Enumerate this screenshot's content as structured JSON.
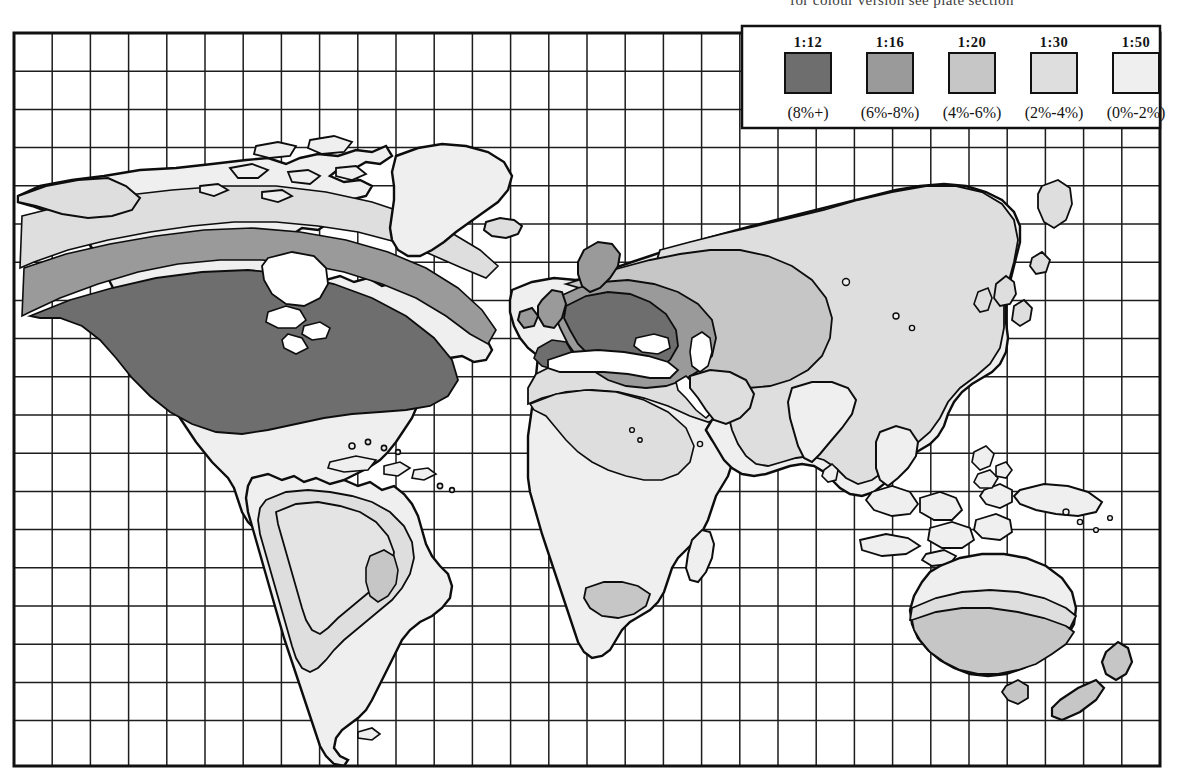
{
  "caption": {
    "text": "for colour version see plate section"
  },
  "map": {
    "title": "World distribution map with shaded ratio classes",
    "projection": "cylindrical",
    "grid": {
      "visible": true,
      "columns": 30,
      "rows": 19,
      "cell_px": 38.2,
      "line_color": "#1d1d1d"
    },
    "frame": {
      "left": 14,
      "top": 33,
      "right": 1160,
      "bottom": 766,
      "border_color": "#111111"
    },
    "ocean_color": "#ffffff",
    "coastline_color": "#0d0d0d"
  },
  "legend": {
    "name": "shading-legend",
    "box": {
      "x": 742,
      "y": 26,
      "width": 418,
      "height": 102
    },
    "entries": [
      {
        "ratio": "1:12",
        "range": "(8%+)",
        "color": "#6e6e6e"
      },
      {
        "ratio": "1:16",
        "range": "(6%-8%)",
        "color": "#9a9a9a"
      },
      {
        "ratio": "1:20",
        "range": "(4%-6%)",
        "color": "#c6c6c6"
      },
      {
        "ratio": "1:30",
        "range": "(2%-4%)",
        "color": "#dedede"
      },
      {
        "ratio": "1:50",
        "range": "(0%-2%)",
        "color": "#efefef"
      }
    ]
  },
  "chart_data": {
    "type": "heatmap",
    "xlabel": "",
    "ylabel": "",
    "legend_position": "top-right",
    "grid": true,
    "classes": [
      {
        "label": "1:12",
        "range": "(8%+)",
        "value_low": 8,
        "value_high": null,
        "color": "#6e6e6e"
      },
      {
        "label": "1:16",
        "range": "(6%-8%)",
        "value_low": 6,
        "value_high": 8,
        "color": "#9a9a9a"
      },
      {
        "label": "1:20",
        "range": "(4%-6%)",
        "value_low": 4,
        "value_high": 6,
        "color": "#c6c6c6"
      },
      {
        "label": "1:30",
        "range": "(2%-4%)",
        "value_low": 2,
        "value_high": 4,
        "color": "#dedede"
      },
      {
        "label": "1:50",
        "range": "(0%-2%)",
        "value_low": 0,
        "value_high": 2,
        "color": "#efefef"
      }
    ],
    "regions": [
      {
        "name": "Alaska",
        "class": "1:30"
      },
      {
        "name": "Arctic Canada",
        "class": "1:50"
      },
      {
        "name": "Northern Canada",
        "class": "1:30"
      },
      {
        "name": "Southern Canada",
        "class": "1:16"
      },
      {
        "name": "United States",
        "class": "1:12"
      },
      {
        "name": "Mexico",
        "class": "1:30"
      },
      {
        "name": "Central America",
        "class": "1:50"
      },
      {
        "name": "Greenland",
        "class": "1:50"
      },
      {
        "name": "Iceland",
        "class": "1:30"
      },
      {
        "name": "British Isles",
        "class": "1:16"
      },
      {
        "name": "Western Europe",
        "class": "1:12"
      },
      {
        "name": "Scandinavia",
        "class": "1:16"
      },
      {
        "name": "Iberia",
        "class": "1:16"
      },
      {
        "name": "Eastern Europe",
        "class": "1:16"
      },
      {
        "name": "Russia",
        "class": "1:20"
      },
      {
        "name": "Siberia",
        "class": "1:30"
      },
      {
        "name": "Central Asia",
        "class": "1:30"
      },
      {
        "name": "China",
        "class": "1:30"
      },
      {
        "name": "Japan",
        "class": "1:30"
      },
      {
        "name": "India",
        "class": "1:50"
      },
      {
        "name": "Southeast Asia",
        "class": "1:50"
      },
      {
        "name": "Indonesia",
        "class": "1:50"
      },
      {
        "name": "Philippines",
        "class": "1:50"
      },
      {
        "name": "North Africa",
        "class": "1:30"
      },
      {
        "name": "Sahara",
        "class": "1:30"
      },
      {
        "name": "West Africa",
        "class": "1:50"
      },
      {
        "name": "Central Africa",
        "class": "1:50"
      },
      {
        "name": "East Africa",
        "class": "1:50"
      },
      {
        "name": "Southern Africa",
        "class": "1:50"
      },
      {
        "name": "South Africa (Cape)",
        "class": "1:30"
      },
      {
        "name": "Madagascar",
        "class": "1:50"
      },
      {
        "name": "Middle East",
        "class": "1:30"
      },
      {
        "name": "Northern South America",
        "class": "1:50"
      },
      {
        "name": "Amazon Basin",
        "class": "1:30"
      },
      {
        "name": "Brazil interior",
        "class": "1:30"
      },
      {
        "name": "Southeast Brazil",
        "class": "1:20"
      },
      {
        "name": "Argentina",
        "class": "1:50"
      },
      {
        "name": "Northern Australia",
        "class": "1:30"
      },
      {
        "name": "Southern Australia",
        "class": "1:20"
      },
      {
        "name": "New Zealand",
        "class": "1:20"
      },
      {
        "name": "New Guinea",
        "class": "1:50"
      }
    ]
  }
}
